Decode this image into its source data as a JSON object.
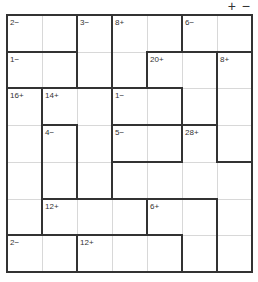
{
  "toolbar": {
    "zoom_in_label": "+",
    "zoom_out_label": "−"
  },
  "puzzle": {
    "size": 7,
    "cages": [
      {
        "clue": "2−",
        "cells": [
          [
            0,
            0
          ],
          [
            0,
            1
          ]
        ]
      },
      {
        "clue": "3−",
        "cells": [
          [
            0,
            2
          ],
          [
            1,
            2
          ]
        ]
      },
      {
        "clue": "8+",
        "cells": [
          [
            0,
            3
          ],
          [
            0,
            4
          ],
          [
            1,
            3
          ]
        ]
      },
      {
        "clue": "6−",
        "cells": [
          [
            0,
            5
          ],
          [
            0,
            6
          ]
        ]
      },
      {
        "clue": "1−",
        "cells": [
          [
            1,
            0
          ],
          [
            1,
            1
          ]
        ]
      },
      {
        "clue": "20+",
        "cells": [
          [
            1,
            4
          ],
          [
            1,
            5
          ],
          [
            2,
            5
          ]
        ]
      },
      {
        "clue": "8+",
        "cells": [
          [
            1,
            6
          ],
          [
            2,
            6
          ],
          [
            3,
            6
          ]
        ]
      },
      {
        "clue": "16+",
        "cells": [
          [
            2,
            0
          ],
          [
            3,
            0
          ],
          [
            4,
            0
          ],
          [
            5,
            0
          ]
        ]
      },
      {
        "clue": "14+",
        "cells": [
          [
            2,
            1
          ],
          [
            2,
            2
          ],
          [
            3,
            2
          ],
          [
            4,
            2
          ]
        ]
      },
      {
        "clue": "1−",
        "cells": [
          [
            2,
            3
          ],
          [
            2,
            4
          ]
        ]
      },
      {
        "clue": "4−",
        "cells": [
          [
            3,
            1
          ],
          [
            4,
            1
          ]
        ]
      },
      {
        "clue": "5−",
        "cells": [
          [
            3,
            3
          ],
          [
            3,
            4
          ]
        ]
      },
      {
        "clue": "28+",
        "cells": [
          [
            3,
            5
          ],
          [
            4,
            3
          ],
          [
            4,
            4
          ],
          [
            4,
            5
          ],
          [
            4,
            6
          ],
          [
            5,
            6
          ],
          [
            6,
            6
          ]
        ]
      },
      {
        "clue": "12+",
        "cells": [
          [
            5,
            1
          ],
          [
            5,
            2
          ],
          [
            5,
            3
          ]
        ]
      },
      {
        "clue": "6+",
        "cells": [
          [
            5,
            4
          ],
          [
            5,
            5
          ],
          [
            6,
            5
          ]
        ]
      },
      {
        "clue": "2−",
        "cells": [
          [
            6,
            0
          ],
          [
            6,
            1
          ]
        ]
      },
      {
        "clue": "12+",
        "cells": [
          [
            6,
            2
          ],
          [
            6,
            3
          ],
          [
            6,
            4
          ]
        ]
      }
    ]
  }
}
